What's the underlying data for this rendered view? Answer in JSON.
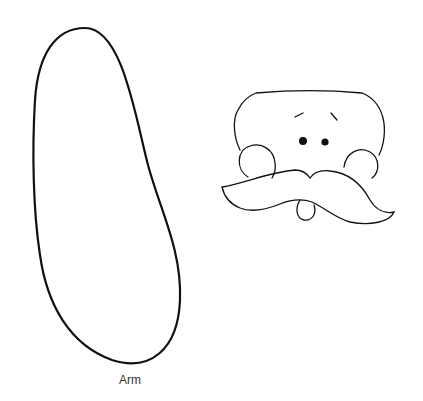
{
  "pieces": [
    {
      "name": "arm",
      "label": "Arm"
    },
    {
      "name": "face",
      "label": ""
    }
  ],
  "colors": {
    "line": "#111111",
    "background": "#ffffff",
    "label": "#333333"
  }
}
